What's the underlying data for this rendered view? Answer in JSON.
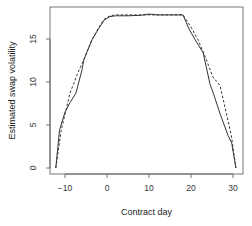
{
  "chart_data": {
    "type": "line",
    "title": "",
    "xlabel": "Contract day",
    "ylabel": "Estimated swap volatility",
    "xlim": [
      -13.5,
      32.5
    ],
    "ylim": [
      -0.7,
      18.7
    ],
    "xticks": [
      -10,
      0,
      10,
      20,
      30
    ],
    "yticks": [
      0,
      5,
      10,
      15
    ],
    "grid": false,
    "legend": null,
    "series": [
      {
        "name": "solid",
        "style": "solid",
        "color": "#333333",
        "x": [
          -12.2,
          -11.3,
          -10,
          -8.8,
          -7.4,
          -6,
          -5.5,
          -3.6,
          -2,
          -0.7,
          0.7,
          2,
          5,
          8,
          10,
          12,
          15,
          18.1,
          19.5,
          21,
          22.9,
          24.5,
          25.3,
          27,
          28.8,
          29.7,
          30.7
        ],
        "y": [
          0,
          4.4,
          6.5,
          7.6,
          8.7,
          11.3,
          12.6,
          14.9,
          16.2,
          17.2,
          17.6,
          17.7,
          17.7,
          17.75,
          17.9,
          17.8,
          17.8,
          17.8,
          16.2,
          14.9,
          13.4,
          9.8,
          8.7,
          6.2,
          3.8,
          2.9,
          0
        ]
      },
      {
        "name": "dashed",
        "style": "dashed",
        "color": "#333333",
        "x": [
          -12.2,
          -10.9,
          -8.8,
          -7,
          -5.5,
          -3.6,
          -2,
          -0.7,
          0.7,
          2,
          5,
          10,
          15,
          18.1,
          20,
          21.7,
          23.5,
          25.2,
          26.9,
          28.3,
          29.6,
          30.7
        ],
        "y": [
          0,
          4.4,
          8.7,
          11,
          12.6,
          14.9,
          16.3,
          17.3,
          17.7,
          17.8,
          17.8,
          17.8,
          17.8,
          17.8,
          16.4,
          14.9,
          12.8,
          10.6,
          9.6,
          6.6,
          3.8,
          0
        ]
      }
    ]
  }
}
